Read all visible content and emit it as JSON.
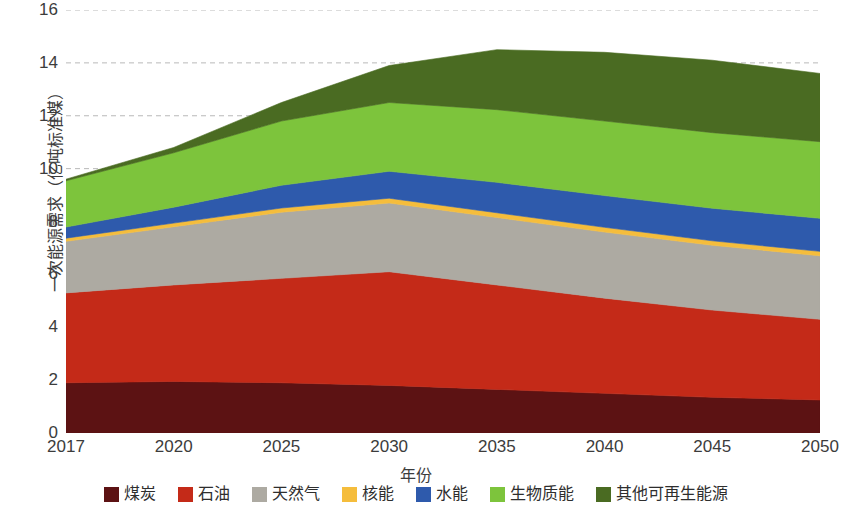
{
  "chart_data": {
    "type": "area",
    "stacked": true,
    "title": "",
    "xlabel": "年份",
    "ylabel": "一次能源需求（亿吨标准煤）",
    "x": [
      "2017",
      "2020",
      "2025",
      "2030",
      "2035",
      "2040",
      "2045",
      "2050"
    ],
    "categories": [
      "2017",
      "2020",
      "2025",
      "2030",
      "2035",
      "2040",
      "2045",
      "2050"
    ],
    "ylim": [
      0,
      16
    ],
    "yticks": [
      0,
      2,
      4,
      6,
      8,
      10,
      12,
      14,
      16
    ],
    "ytick_labels": [
      "0",
      "2",
      "4",
      "6",
      "8",
      "10",
      "12",
      "14",
      "16"
    ],
    "grid": "horizontal-dashed",
    "legend_position": "bottom",
    "series": [
      {
        "name": "煤炭",
        "color": "#5C1213",
        "values": [
          1.9,
          1.95,
          1.9,
          1.8,
          1.65,
          1.5,
          1.35,
          1.25
        ]
      },
      {
        "name": "石油",
        "color": "#C42A18",
        "values": [
          3.4,
          3.65,
          3.95,
          4.3,
          3.95,
          3.6,
          3.3,
          3.05
        ]
      },
      {
        "name": "天然气",
        "color": "#ADAAA2",
        "values": [
          1.95,
          2.2,
          2.5,
          2.6,
          2.55,
          2.5,
          2.45,
          2.4
        ]
      },
      {
        "name": "核能",
        "color": "#F5BD3C",
        "values": [
          0.12,
          0.14,
          0.16,
          0.18,
          0.18,
          0.18,
          0.17,
          0.17
        ]
      },
      {
        "name": "水能",
        "color": "#2E5AAC",
        "values": [
          0.42,
          0.6,
          0.86,
          1.02,
          1.15,
          1.2,
          1.23,
          1.25
        ]
      },
      {
        "name": "生物质能",
        "color": "#7DC43C",
        "values": [
          1.75,
          2.06,
          2.43,
          2.6,
          2.75,
          2.82,
          2.86,
          2.9
        ]
      },
      {
        "name": "其他可再生能源",
        "color": "#4A6B22",
        "values": [
          0.06,
          0.2,
          0.7,
          1.4,
          2.27,
          2.6,
          2.74,
          2.58
        ]
      }
    ],
    "totals": [
      9.6,
      10.8,
      12.5,
      13.9,
      14.5,
      14.4,
      15.1,
      15.6
    ],
    "legend_entries": [
      {
        "label": "煤炭",
        "color": "#5C1213"
      },
      {
        "label": "石油",
        "color": "#C42A18"
      },
      {
        "label": "天然气",
        "color": "#ADAAA2"
      },
      {
        "label": "核能",
        "color": "#F5BD3C"
      },
      {
        "label": "水能",
        "color": "#2E5AAC"
      },
      {
        "label": "生物质能",
        "color": "#7DC43C"
      },
      {
        "label": "其他可再生能源",
        "color": "#4A6B22"
      }
    ]
  },
  "axes": {
    "y_title": "一次能源需求（亿吨标准煤）",
    "x_title": "年份",
    "y_ticks": [
      "16",
      "14",
      "12",
      "10",
      "8",
      "6",
      "4",
      "2",
      "0"
    ],
    "x_ticks": [
      "2017",
      "2020",
      "2025",
      "2030",
      "2035",
      "2040",
      "2045",
      "2050"
    ]
  },
  "colors": {
    "grid": "#b9b9b9",
    "text": "#3c3c3c",
    "background": "#ffffff"
  }
}
